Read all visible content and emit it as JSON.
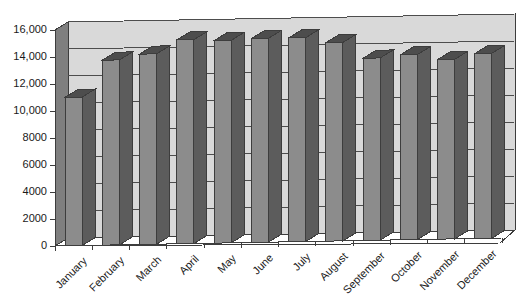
{
  "chart_data": {
    "type": "bar",
    "title": "",
    "subtitle": "",
    "xlabel": "",
    "ylabel": "",
    "categories": [
      "January",
      "February",
      "March",
      "April",
      "May",
      "June",
      "July",
      "August",
      "September",
      "October",
      "November",
      "December"
    ],
    "values": [
      11000,
      13700,
      14100,
      15100,
      15000,
      15100,
      15100,
      14700,
      13500,
      13700,
      13300,
      13700
    ],
    "series": [
      {
        "name": "Monthly total",
        "values": [
          11000,
          13700,
          14100,
          15100,
          15000,
          15100,
          15100,
          14700,
          13500,
          13700,
          13300,
          13700
        ]
      }
    ],
    "ylim": [
      0,
      16000
    ],
    "ytick_values": [
      0,
      2000,
      4000,
      6000,
      8000,
      10000,
      12000,
      14000,
      16000
    ],
    "ytick_labels": [
      "0",
      "2000",
      "4000",
      "6000",
      "8000",
      "10,000",
      "12,000",
      "14,000",
      "16,000"
    ],
    "grid": true,
    "grid_axis": "y",
    "legend": false,
    "legend_position": "none",
    "style": "3d-column",
    "xtick_label_rotation": -45,
    "annotations": []
  },
  "colors": {
    "background": "#ffffff",
    "plot_back_wall": "#d9d9d9",
    "plot_back_wall_upper": "#dedede",
    "axis_wall": "#7f7f7f",
    "floor": "#ffffff",
    "bar_front": "#8c8c8c",
    "bar_top": "#4d4d4d",
    "bar_side": "#5c5c5c",
    "gridline": "#4d4d4d",
    "axis_line": "#3d3d3d",
    "text": "#1a1a1a"
  }
}
